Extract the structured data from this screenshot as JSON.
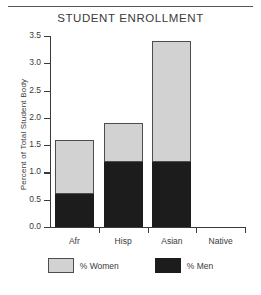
{
  "figure": {
    "title": "STUDENT ENROLLMENT",
    "has_top_rule": true
  },
  "chart_data": {
    "type": "bar",
    "stacked": true,
    "title": "STUDENT ENROLLMENT",
    "xlabel": "",
    "ylabel": "Percent of Total Student Body",
    "categories": [
      "Afr",
      "Hisp",
      "Asian",
      "Native"
    ],
    "series": [
      {
        "name": "% Men",
        "values": [
          0.6,
          1.2,
          1.2,
          0.0
        ],
        "color": "#1c1c1c"
      },
      {
        "name": "% Women",
        "values": [
          1.0,
          0.7,
          2.2,
          0.0
        ],
        "color": "#d2d2d2"
      }
    ],
    "totals": [
      1.6,
      1.9,
      3.4,
      0.0
    ],
    "ylim": [
      0.0,
      3.5
    ],
    "ytick_labels": [
      "0.0",
      "0.5",
      "1.0",
      "1.5",
      "2.0",
      "2.5",
      "3.0",
      "3.5"
    ],
    "ytick_values": [
      0.0,
      0.5,
      1.0,
      1.5,
      2.0,
      2.5,
      3.0,
      3.5
    ],
    "grid": false,
    "legend_position": "below",
    "legend": [
      {
        "label": "% Women",
        "color": "#d2d2d2"
      },
      {
        "label": "% Men",
        "color": "#1c1c1c"
      }
    ]
  }
}
